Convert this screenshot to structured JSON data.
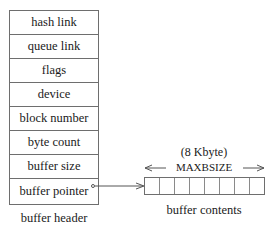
{
  "buffer_header": {
    "fields": [
      {
        "label": "hash link"
      },
      {
        "label": "queue link"
      },
      {
        "label": "flags"
      },
      {
        "label": "device"
      },
      {
        "label": "block number"
      },
      {
        "label": "byte count"
      },
      {
        "label": "buffer size"
      },
      {
        "label": "buffer pointer"
      }
    ],
    "caption": "buffer header"
  },
  "buffer_contents": {
    "size_note": "(8 Kbyte)",
    "size_name": "MAXBSIZE",
    "cell_count": 8,
    "caption": "buffer contents"
  },
  "connector": {
    "from": "buffer pointer",
    "to": "buffer contents",
    "style": "arrow"
  },
  "colors": {
    "line": "#6e6e6e",
    "text": "#1a1a1a",
    "background": "#ffffff"
  }
}
